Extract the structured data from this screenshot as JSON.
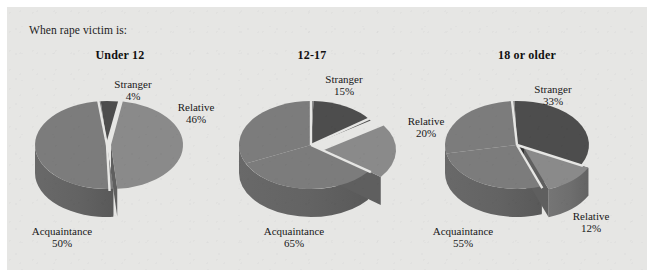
{
  "figure": {
    "caption": "When rape victim is:",
    "background_color": "#e6e6e4",
    "page_color": "#ffffff"
  },
  "colors": {
    "stranger_top": "#4d4d4d",
    "stranger_side": "#3a3a3a",
    "relative_top": "#8a8a8a",
    "relative_side": "#6e6e6e",
    "acquaintance_top": "#7c7c7c",
    "acquaintance_side": "#636363",
    "gap": "#e6e6e4",
    "text": "#181818"
  },
  "panels": [
    {
      "title": "Under 12",
      "labels": {
        "stranger": {
          "name": "Stranger",
          "pct": "4%"
        },
        "relative": {
          "name": "Relative",
          "pct": "46%"
        },
        "acquaintance": {
          "name": "Acquaintance",
          "pct": "50%"
        }
      }
    },
    {
      "title": "12-17",
      "labels": {
        "stranger": {
          "name": "Stranger",
          "pct": "15%"
        },
        "relative": {
          "name": "Relative",
          "pct": "20%"
        },
        "acquaintance": {
          "name": "Acquaintance",
          "pct": "65%"
        }
      }
    },
    {
      "title": "18 or older",
      "labels": {
        "stranger": {
          "name": "Stranger",
          "pct": "33%"
        },
        "relative": {
          "name": "Relative",
          "pct": "12%"
        },
        "acquaintance": {
          "name": "Acquaintance",
          "pct": "55%"
        }
      }
    }
  ],
  "chart_data": [
    {
      "type": "pie",
      "title": "Under 12",
      "categories": [
        "Stranger",
        "Relative",
        "Acquaintance"
      ],
      "values": [
        4,
        46,
        50
      ],
      "unit": "percent",
      "exploded": [
        "Relative"
      ],
      "three_d": true
    },
    {
      "type": "pie",
      "title": "12-17",
      "categories": [
        "Stranger",
        "Relative",
        "Acquaintance"
      ],
      "values": [
        15,
        20,
        65
      ],
      "unit": "percent",
      "exploded": [
        "Relative"
      ],
      "three_d": true
    },
    {
      "type": "pie",
      "title": "18 or older",
      "categories": [
        "Stranger",
        "Relative",
        "Acquaintance"
      ],
      "values": [
        33,
        12,
        55
      ],
      "unit": "percent",
      "exploded": [
        "Relative"
      ],
      "three_d": true
    }
  ]
}
